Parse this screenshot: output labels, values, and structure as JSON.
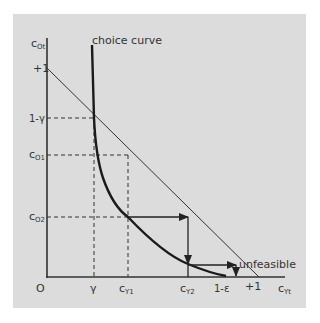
{
  "diagram": {
    "axes": {
      "y_label": "c",
      "y_label_sub": "Ot",
      "x_label": "c",
      "x_label_sub": "Yt",
      "origin": "O"
    },
    "y_ticks": [
      {
        "label": "+1",
        "sub": ""
      },
      {
        "label": "1-γ",
        "sub": ""
      },
      {
        "label": "c",
        "sub": "O1"
      },
      {
        "label": "c",
        "sub": "O2"
      }
    ],
    "x_ticks": [
      {
        "label": "γ",
        "sub": ""
      },
      {
        "label": "c",
        "sub": "Y1"
      },
      {
        "label": "c",
        "sub": "Y2"
      },
      {
        "label": "1-ε",
        "sub": ""
      },
      {
        "label": "+1",
        "sub": ""
      }
    ],
    "annotations": {
      "choice_curve": "choice curve",
      "unfeasible": "unfeasible"
    },
    "colors": {
      "background": "#dcdcdc",
      "lines": "#222222"
    }
  }
}
